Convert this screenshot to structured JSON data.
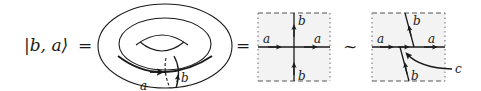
{
  "equation": {
    "lhs": "|b, a⟩",
    "equals_1": "=",
    "equals_2": "=",
    "equivalence": "~"
  },
  "torus": {
    "cycle_a_label": "a",
    "cycle_b_label": "b"
  },
  "square_1": {
    "label_a_left": "a",
    "label_a_right": "a",
    "label_b_top": "b",
    "label_b_bottom": "b"
  },
  "square_2": {
    "label_a_left": "a",
    "label_a_right": "a",
    "label_b_top": "b",
    "label_b_bottom": "b",
    "label_c": "c"
  },
  "colors": {
    "stroke": "#1a1a1a",
    "square_fill": "#f3f3f3",
    "dashed_border": "#8a8a8a"
  }
}
